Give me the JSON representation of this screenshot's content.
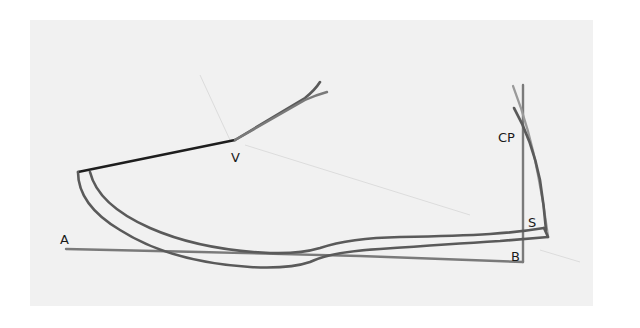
{
  "diagram": {
    "labels": {
      "A": "A",
      "V": "V",
      "CP": "CP",
      "S": "S",
      "B": "B"
    },
    "colors": {
      "sheet": "#f1f1f1",
      "background": "#ffffff",
      "black_line": "#1e1e1e",
      "dark_line": "#5a5a5a",
      "mid_line": "#7a7a7a",
      "light_line": "#9a9a9a"
    }
  }
}
